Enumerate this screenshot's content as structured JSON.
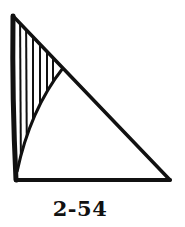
{
  "figure": {
    "label": "2-54",
    "colors": {
      "stroke": "#111111",
      "background": "#ffffff"
    },
    "vertices": {
      "top": [
        13,
        16
      ],
      "bottom_left": [
        16,
        180
      ],
      "bottom_right": [
        170,
        180
      ]
    },
    "hatched_region": {
      "pattern": "vertical-lines",
      "line_count": 6
    }
  }
}
